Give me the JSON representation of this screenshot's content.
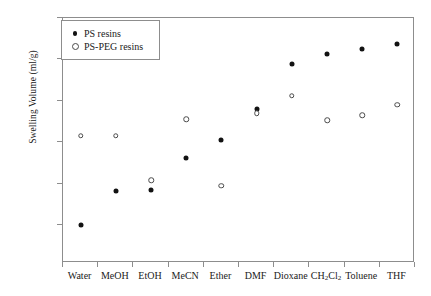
{
  "chart_data": {
    "type": "scatter",
    "title": "",
    "xlabel": "",
    "ylabel": "Swelling Volume (ml/g)",
    "ylim": [
      0,
      10
    ],
    "yticks": [
      0,
      2,
      4,
      6,
      8,
      10
    ],
    "ytick_labels": [
      "0",
      "2",
      "4",
      "6",
      "8",
      "10"
    ],
    "grid": false,
    "legend_position": "top-left",
    "categories": [
      "Water",
      "MeOH",
      "EtOH",
      "MeCN",
      "Ether",
      "DMF",
      "Dioxane",
      "CH2Cl2",
      "Toluene",
      "THF"
    ],
    "category_labels_html": [
      "Water",
      "MeOH",
      "EtOH",
      "MeCN",
      "Ether",
      "DMF",
      "Dioxane",
      "CH<sub>2</sub>Cl<sub>2</sub>",
      "Toluene",
      "THF"
    ],
    "series": [
      {
        "name": "PS resins",
        "marker": "filled-circle",
        "color": "#121212",
        "values": [
          0.0,
          1.65,
          1.7,
          3.25,
          4.1,
          5.6,
          7.8,
          8.25,
          8.5,
          8.75
        ]
      },
      {
        "name": "PS-PEG resins",
        "marker": "open-circle",
        "color": "#4a4a4a",
        "values": [
          4.3,
          4.3,
          2.15,
          5.1,
          1.9,
          5.4,
          6.25,
          5.05,
          5.3,
          5.8
        ]
      }
    ]
  },
  "legend": {
    "items": [
      {
        "label": "PS resins",
        "marker": "filled-circle"
      },
      {
        "label": "PS-PEG resins",
        "marker": "open-circle"
      }
    ]
  },
  "axis": {
    "y_label": "Swelling Volume (ml/g)"
  }
}
